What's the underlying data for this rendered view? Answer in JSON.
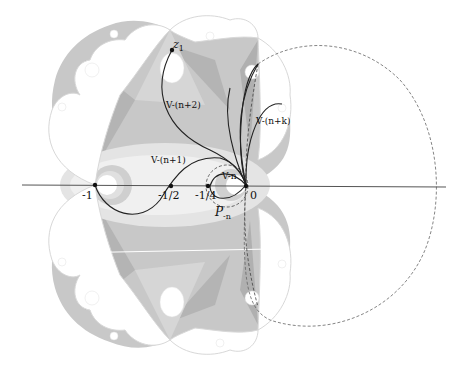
{
  "figure": {
    "axis": {
      "ticks": [
        {
          "label": "-1",
          "x": 95
        },
        {
          "label": "-1/2",
          "x": 171
        },
        {
          "label": "-1/4",
          "x": 208
        },
        {
          "label": "0",
          "x": 246
        }
      ]
    },
    "labels": {
      "z1": "z",
      "z1_sub": "1",
      "v_n2": "V-(n+2)",
      "v_n1": "V-(n+1)",
      "v_n": "V-n",
      "v_nk": "V-(n+k)",
      "p_n": "P",
      "p_n_sub": "-n"
    },
    "colors": {
      "dark_gray": "#b4b4b4",
      "mid_gray": "#c8c8c8",
      "light_gray": "#dcdcdc",
      "pale": "#ececec",
      "boundary": "#d8d8d8",
      "curve": "#222222",
      "axis": "#555555"
    }
  }
}
